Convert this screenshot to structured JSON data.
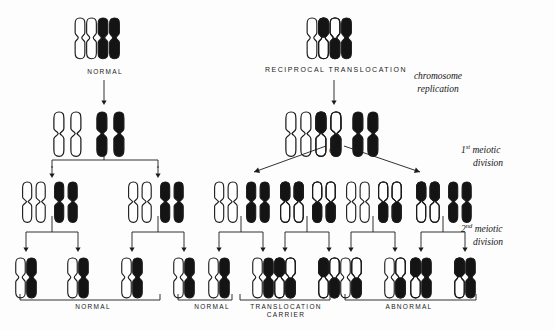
{
  "figure": {
    "title_labels": {
      "normal_top": "NORMAL",
      "reciprocal_translocation": "RECIPROCAL  TRANSLOCATION",
      "or": "OR"
    },
    "stage_labels": [
      {
        "line1": "chromosome",
        "line2": "replication",
        "sup": ""
      },
      {
        "line1": "meiotic",
        "line2": "division",
        "sup": "st",
        "num": "1"
      },
      {
        "line1": "meiotic",
        "line2": "division",
        "sup": "nd",
        "num": "2"
      }
    ],
    "outcome_labels": [
      {
        "name": "normal_left",
        "text": "NORMAL"
      },
      {
        "name": "normal_mid",
        "text": "NORMAL"
      },
      {
        "name": "translocation_carrier",
        "text": "TRANSLOCATION\nCARRIER",
        "line1": "TRANSLOCATION",
        "line2": "CARRIER"
      },
      {
        "name": "abnormal",
        "text": "ABNORMAL"
      }
    ],
    "colors": {
      "ink": "#1b1b1b",
      "white_chromosome_fill": "#ffffff",
      "black_chromosome_fill": "#141414",
      "background": "#fdfdfd",
      "outline": "#1b1b1b"
    },
    "parent_cells": [
      {
        "name": "normal-parent",
        "label": "NORMAL",
        "chromosomes": [
          {
            "pattern": "white",
            "note": "normal chromosome A"
          },
          {
            "pattern": "white",
            "note": "normal chromosome A homolog"
          },
          {
            "pattern": "black",
            "note": "normal chromosome B"
          },
          {
            "pattern": "black",
            "note": "normal chromosome B homolog"
          }
        ]
      },
      {
        "name": "translocation-parent",
        "label": "RECIPROCAL  TRANSLOCATION",
        "chromosomes": [
          {
            "pattern": "white",
            "note": "normal A"
          },
          {
            "pattern": "white-black-top",
            "note": "derivative A with black segment"
          },
          {
            "pattern": "black-white-top",
            "note": "derivative B with white segment"
          },
          {
            "pattern": "black",
            "note": "normal B"
          }
        ]
      }
    ],
    "replicated_cells": [
      {
        "name": "normal-replicated",
        "groups": [
          {
            "pattern": "white",
            "count": 2
          },
          {
            "pattern": "black",
            "count": 2
          }
        ]
      },
      {
        "name": "translocation-replicated",
        "groups": [
          {
            "pattern": "white",
            "count": 2
          },
          {
            "pattern": "white-black-top",
            "count": 1
          },
          {
            "pattern": "black-white-top",
            "count": 1
          },
          {
            "pattern": "black",
            "count": 2
          }
        ]
      }
    ],
    "first_division_products": [
      {
        "name": "normal-daughter-1",
        "dyads": [
          {
            "pattern": "white",
            "count": 2
          },
          {
            "pattern": "black",
            "count": 2
          }
        ]
      },
      {
        "name": "normal-daughter-2",
        "dyads": [
          {
            "pattern": "white",
            "count": 2
          },
          {
            "pattern": "black",
            "count": 2
          }
        ]
      },
      {
        "name": "carrier-daughter-1",
        "dyads": [
          {
            "pattern": "white",
            "count": 2
          },
          {
            "pattern": "black",
            "count": 2
          }
        ]
      },
      {
        "name": "carrier-daughter-2",
        "dyads": [
          {
            "pattern": "white-black-top",
            "count": 2
          },
          {
            "pattern": "black-white-top",
            "count": 2
          }
        ]
      },
      {
        "name": "abnormal-daughter-1",
        "dyads": [
          {
            "pattern": "white",
            "count": 2
          },
          {
            "pattern": "black-white-top",
            "count": 2
          }
        ]
      },
      {
        "name": "abnormal-daughter-2",
        "dyads": [
          {
            "pattern": "white-black-top",
            "count": 2
          },
          {
            "pattern": "black",
            "count": 2
          }
        ]
      }
    ],
    "gametes": [
      {
        "name": "gamete-1",
        "group": "normal_left",
        "chromosomes": [
          "white",
          "black"
        ]
      },
      {
        "name": "gamete-2",
        "group": "normal_left",
        "chromosomes": [
          "white",
          "black"
        ]
      },
      {
        "name": "gamete-3",
        "group": "normal_left",
        "chromosomes": [
          "white",
          "black"
        ]
      },
      {
        "name": "gamete-4",
        "group": "normal_left",
        "chromosomes": [
          "white",
          "black"
        ]
      },
      {
        "name": "gamete-5",
        "group": "normal_mid",
        "chromosomes": [
          "white",
          "black"
        ]
      },
      {
        "name": "gamete-6",
        "group": "normal_mid",
        "chromosomes": [
          "white",
          "black"
        ]
      },
      {
        "name": "gamete-7",
        "group": "translocation_carrier",
        "chromosomes": [
          "white-black-top",
          "black-white-top"
        ]
      },
      {
        "name": "gamete-8",
        "group": "translocation_carrier",
        "chromosomes": [
          "white-black-top",
          "black-white-top"
        ]
      },
      {
        "name": "gamete-9",
        "group": "abnormal",
        "chromosomes": [
          "white",
          "black-white-top"
        ]
      },
      {
        "name": "gamete-10",
        "group": "abnormal",
        "chromosomes": [
          "white",
          "black-white-top"
        ]
      },
      {
        "name": "gamete-11",
        "group": "abnormal",
        "chromosomes": [
          "white-black-top",
          "black"
        ]
      },
      {
        "name": "gamete-12",
        "group": "abnormal",
        "chromosomes": [
          "white-black-top",
          "black"
        ]
      }
    ]
  }
}
